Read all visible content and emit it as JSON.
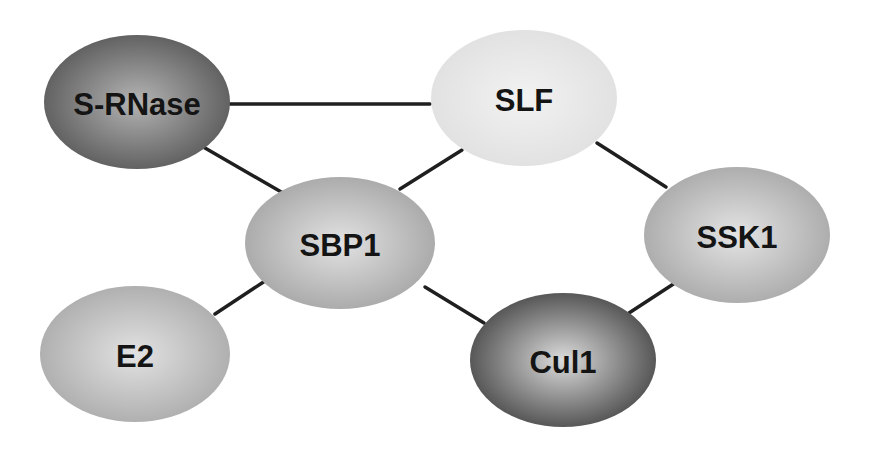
{
  "diagram": {
    "type": "protein-interaction-network",
    "background": "#ffffff",
    "nodes": [
      {
        "id": "srnase",
        "label": "S-RNase",
        "cx": 137,
        "cy": 102,
        "rx": 93,
        "ry": 67,
        "center_color": "#b4b4b4",
        "edge_color": "#5a5a5a"
      },
      {
        "id": "slf",
        "label": "SLF",
        "cx": 524,
        "cy": 98,
        "rx": 93,
        "ry": 68,
        "center_color": "#f2f2f2",
        "edge_color": "#e0e0e0"
      },
      {
        "id": "sbp1",
        "label": "SBP1",
        "cx": 340,
        "cy": 243,
        "rx": 95,
        "ry": 66,
        "center_color": "#e2e2e2",
        "edge_color": "#a6a6a6"
      },
      {
        "id": "ssk1",
        "label": "SSK1",
        "cx": 737,
        "cy": 235,
        "rx": 93,
        "ry": 68,
        "center_color": "#e4e4e4",
        "edge_color": "#a8a8a8"
      },
      {
        "id": "e2",
        "label": "E2",
        "cx": 135,
        "cy": 354,
        "rx": 95,
        "ry": 68,
        "center_color": "#e2e2e2",
        "edge_color": "#ababab"
      },
      {
        "id": "cul1",
        "label": "Cul1",
        "cx": 563,
        "cy": 360,
        "rx": 93,
        "ry": 67,
        "center_color": "#dcdcdc",
        "edge_color": "#4a4a4a"
      }
    ],
    "edges": [
      {
        "from": "srnase",
        "to": "slf",
        "x1": 230,
        "y1": 104,
        "x2": 430,
        "y2": 104
      },
      {
        "from": "srnase",
        "to": "sbp1",
        "x1": 205,
        "y1": 148,
        "x2": 283,
        "y2": 193
      },
      {
        "from": "slf",
        "to": "sbp1",
        "x1": 462,
        "y1": 150,
        "x2": 400,
        "y2": 189
      },
      {
        "from": "slf",
        "to": "ssk1",
        "x1": 597,
        "y1": 143,
        "x2": 666,
        "y2": 187
      },
      {
        "from": "sbp1",
        "to": "e2",
        "x1": 265,
        "y1": 281,
        "x2": 215,
        "y2": 314
      },
      {
        "from": "sbp1",
        "to": "cul1",
        "x1": 425,
        "y1": 287,
        "x2": 484,
        "y2": 323
      },
      {
        "from": "cul1",
        "to": "ssk1",
        "x1": 629,
        "y1": 313,
        "x2": 678,
        "y2": 281
      }
    ],
    "edge_color": "#1f1f1f"
  }
}
